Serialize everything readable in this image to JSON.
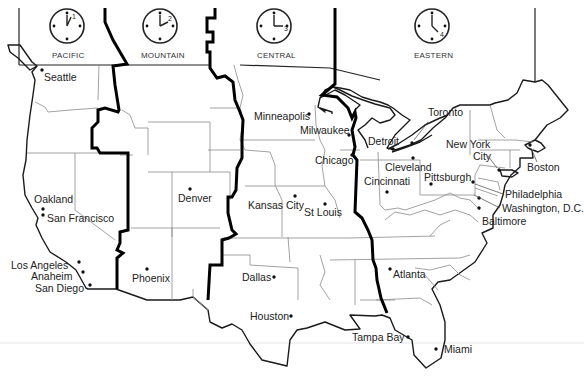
{
  "map": {
    "title": "U.S. Time Zones",
    "zones": [
      {
        "name": "PACIFIC",
        "clock_hour": "1",
        "x": 62
      },
      {
        "name": "MOUNTAIN",
        "clock_hour": "2",
        "x": 158
      },
      {
        "name": "CENTRAL",
        "clock_hour": "3",
        "x": 272
      },
      {
        "name": "EASTERN",
        "clock_hour": "4",
        "x": 431
      }
    ],
    "cities": [
      {
        "name": "Seattle"
      },
      {
        "name": "Oakland"
      },
      {
        "name": "San Francisco"
      },
      {
        "name": "Los Angeles"
      },
      {
        "name": "Anaheim"
      },
      {
        "name": "San Diego"
      },
      {
        "name": "Phoenix"
      },
      {
        "name": "Denver"
      },
      {
        "name": "Minneapolis"
      },
      {
        "name": "Milwaukee"
      },
      {
        "name": "Chicago"
      },
      {
        "name": "Kansas City"
      },
      {
        "name": "St Louis"
      },
      {
        "name": "Dallas"
      },
      {
        "name": "Houston"
      },
      {
        "name": "Detroit"
      },
      {
        "name": "Toronto"
      },
      {
        "name": "Cleveland"
      },
      {
        "name": "Cincinnati"
      },
      {
        "name": "Pittsburgh"
      },
      {
        "name": "New York City"
      },
      {
        "name": "Boston"
      },
      {
        "name": "Philadelphia"
      },
      {
        "name": "Washington, D.C."
      },
      {
        "name": "Baltimore"
      },
      {
        "name": "Atlanta"
      },
      {
        "name": "Tampa Bay"
      },
      {
        "name": "Miami"
      }
    ],
    "labels": {
      "new_york_line1": "New York",
      "new_york_line2": "City"
    }
  }
}
